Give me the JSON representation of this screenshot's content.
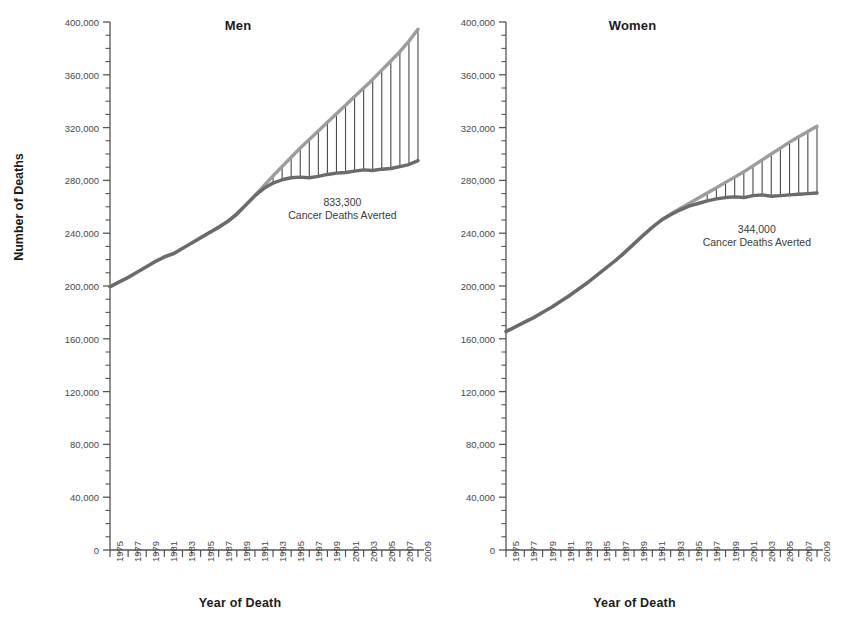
{
  "figure": {
    "background": "#ffffff",
    "expected_color": "#9d9d9d",
    "observed_color": "#6b6b6b",
    "axis_color": "#555555",
    "text_color": "#3a3a3a"
  },
  "axes": {
    "ylabel": "Number of Deaths",
    "xlabel_men": "Year of Death",
    "xlabel_women": "Year of Death",
    "ylim": [
      0,
      400000
    ],
    "ytick_step": 40000,
    "yminor_step": 10000,
    "xlim": [
      1975,
      2009
    ],
    "ytick_labels": [
      "0",
      "40,000",
      "80,000",
      "120,000",
      "160,000",
      "200,000",
      "240,000",
      "280,000",
      "320,000",
      "360,000",
      "400,000"
    ],
    "ytick_values": [
      0,
      40000,
      80000,
      120000,
      160000,
      200000,
      240000,
      280000,
      320000,
      360000,
      400000
    ],
    "xtick_labels": [
      "1975",
      "1977",
      "1979",
      "1981",
      "1983",
      "1985",
      "1987",
      "1989",
      "1991",
      "1993",
      "1995",
      "1997",
      "1999",
      "2001",
      "2003",
      "2005",
      "2007",
      "2009"
    ],
    "xtick_values": [
      1975,
      1977,
      1979,
      1981,
      1983,
      1985,
      1987,
      1989,
      1991,
      1993,
      1995,
      1997,
      1999,
      2001,
      2003,
      2005,
      2007,
      2009
    ],
    "grid": false,
    "legend": "none"
  },
  "panels": [
    {
      "key": "men",
      "title": "Men",
      "annotation": {
        "number": "833,300",
        "caption": "Cancer Deaths Averted"
      }
    },
    {
      "key": "women",
      "title": "Women",
      "annotation": {
        "number": "344,000",
        "caption": "Cancer Deaths Averted"
      }
    }
  ],
  "chart_data": [
    {
      "type": "line",
      "title": "Men",
      "xlabel": "Year of Death",
      "ylabel": "Number of Deaths",
      "xlim": [
        1975,
        2009
      ],
      "ylim": [
        0,
        400000
      ],
      "grid": false,
      "annotation": "833,300 Cancer Deaths Averted",
      "x": [
        1975,
        1976,
        1977,
        1978,
        1979,
        1980,
        1981,
        1982,
        1983,
        1984,
        1985,
        1986,
        1987,
        1988,
        1989,
        1990,
        1991,
        1992,
        1993,
        1994,
        1995,
        1996,
        1997,
        1998,
        1999,
        2000,
        2001,
        2002,
        2003,
        2004,
        2005,
        2006,
        2007,
        2008,
        2009
      ],
      "series": [
        {
          "name": "Expected number of cancer deaths (1991 rates held constant)",
          "color": "#9d9d9d",
          "values": [
            199500,
            203000,
            206500,
            210500,
            214500,
            218500,
            222000,
            224500,
            228500,
            232500,
            236500,
            240500,
            244500,
            249000,
            254500,
            261500,
            268500,
            276000,
            283500,
            290500,
            297500,
            304500,
            311000,
            317500,
            324000,
            330500,
            337000,
            343500,
            350000,
            356500,
            363500,
            370500,
            377500,
            385500,
            394500
          ]
        },
        {
          "name": "Observed number of cancer deaths",
          "color": "#6b6b6b",
          "values": [
            199500,
            203000,
            206500,
            210500,
            214500,
            218500,
            222000,
            224500,
            228500,
            232500,
            236500,
            240500,
            244500,
            249000,
            254500,
            261500,
            268500,
            274000,
            278000,
            280500,
            282000,
            282500,
            282000,
            283000,
            284500,
            285500,
            286000,
            287000,
            288000,
            287500,
            288500,
            289000,
            290500,
            292000,
            295000
          ]
        }
      ]
    },
    {
      "type": "line",
      "title": "Women",
      "xlabel": "Year of Death",
      "ylabel": "Number of Deaths",
      "xlim": [
        1975,
        2009
      ],
      "ylim": [
        0,
        400000
      ],
      "grid": false,
      "annotation": "344,000 Cancer Deaths Averted",
      "x": [
        1975,
        1976,
        1977,
        1978,
        1979,
        1980,
        1981,
        1982,
        1983,
        1984,
        1985,
        1986,
        1987,
        1988,
        1989,
        1990,
        1991,
        1992,
        1993,
        1994,
        1995,
        1996,
        1997,
        1998,
        1999,
        2000,
        2001,
        2002,
        2003,
        2004,
        2005,
        2006,
        2007,
        2008,
        2009
      ],
      "series": [
        {
          "name": "Expected number of cancer deaths (1991 rates held constant)",
          "color": "#9d9d9d",
          "values": [
            165500,
            169000,
            172500,
            176000,
            180000,
            184000,
            188500,
            193000,
            198000,
            203000,
            208500,
            214000,
            219500,
            225500,
            232000,
            238500,
            244500,
            250000,
            254500,
            258500,
            262500,
            266500,
            270500,
            274500,
            278500,
            282500,
            286500,
            291000,
            295500,
            300000,
            304500,
            309000,
            313000,
            317000,
            321000
          ]
        },
        {
          "name": "Observed number of cancer deaths",
          "color": "#6b6b6b",
          "values": [
            165500,
            169000,
            172500,
            176000,
            180000,
            184000,
            188500,
            193000,
            198000,
            203000,
            208500,
            214000,
            219500,
            225500,
            232000,
            238500,
            244500,
            250000,
            254000,
            257500,
            260500,
            262500,
            264500,
            266000,
            267000,
            267500,
            267000,
            268500,
            269000,
            268000,
            268500,
            269000,
            269500,
            270000,
            270500
          ]
        }
      ]
    }
  ]
}
